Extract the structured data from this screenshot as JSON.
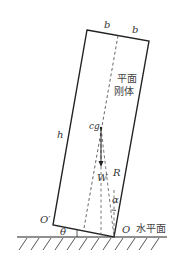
{
  "diagram": {
    "title_line1": "平面",
    "title_line2": "刚体",
    "labels": {
      "b_left": "b",
      "b_right": "b",
      "h": "h",
      "cg": "cg",
      "W": "W",
      "R": "R",
      "alpha": "α",
      "theta": "θ",
      "O": "O",
      "O_prime": "O′",
      "ground": "水平面"
    },
    "colors": {
      "stroke": "#222222",
      "dashed": "#555555",
      "text": "#333333"
    }
  }
}
